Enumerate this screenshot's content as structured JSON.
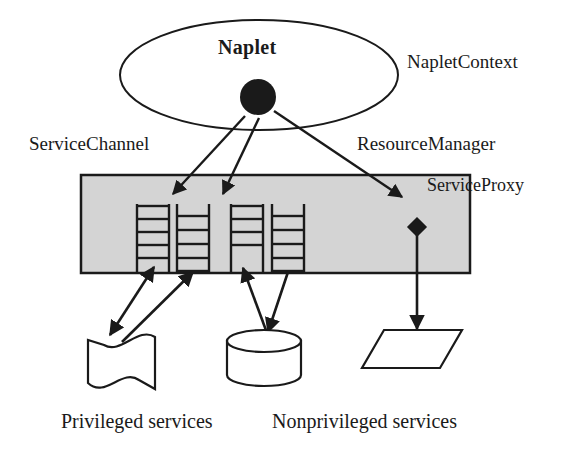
{
  "diagram": {
    "colors": {
      "stroke": "#1a1a1a",
      "gray_box_fill": "#d4d4d4",
      "shape_fill": "#ffffff",
      "text": "#1a1a1a"
    },
    "labels": {
      "naplet": "Naplet",
      "naplet_context": "NapletContext",
      "service_channel": "ServiceChannel",
      "resource_manager": "ResourceManager",
      "service_proxy": "ServiceProxy",
      "privileged_services": "Privileged services",
      "nonprivileged_services": "Nonprivileged services"
    },
    "shapes": {
      "context_ellipse": {
        "cx": 259,
        "cy": 75,
        "rx": 139,
        "ry": 55
      },
      "naplet_node": {
        "cx": 258,
        "cy": 97,
        "r": 18
      },
      "gray_box": {
        "x": 81,
        "y": 175,
        "width": 389,
        "height": 98
      },
      "ladders": [
        {
          "x": 136,
          "y": 204,
          "width": 34,
          "height": 68,
          "rungs": 5
        },
        {
          "x": 176,
          "y": 204,
          "width": 34,
          "height": 68,
          "rungs": 5
        },
        {
          "x": 230,
          "y": 204,
          "width": 34,
          "height": 68,
          "rungs": 5
        },
        {
          "x": 271,
          "y": 204,
          "width": 34,
          "height": 68,
          "rungs": 5
        }
      ],
      "proxy_diamond": {
        "cx": 417,
        "cy": 227,
        "size": 9
      },
      "document": {
        "x": 88,
        "y": 330,
        "width": 67,
        "height": 55
      },
      "cylinder": {
        "cx": 264,
        "cy": 358,
        "rx": 37,
        "ry": 11,
        "top": 330,
        "bottom": 386
      },
      "parallelogram": {
        "x": 362,
        "y": 330,
        "width": 100,
        "height": 38,
        "skew": 22
      }
    },
    "connections": [
      {
        "name": "naplet-to-channel-1",
        "from": [
          245,
          114
        ],
        "to": [
          172,
          193
        ],
        "arrow": "end"
      },
      {
        "name": "naplet-to-channel-2",
        "from": [
          262,
          116
        ],
        "to": [
          222,
          193
        ],
        "arrow": "end"
      },
      {
        "name": "naplet-to-proxy",
        "from": [
          273,
          110
        ],
        "to": [
          403,
          196
        ],
        "arrow": "end"
      },
      {
        "name": "ladder1-to-document",
        "from": [
          152,
          272
        ],
        "to": [
          108,
          336
        ],
        "arrow": "both"
      },
      {
        "name": "ladder2-to-document",
        "from": [
          190,
          272
        ],
        "to": [
          120,
          338
        ],
        "arrow": "start"
      },
      {
        "name": "ladder3-to-cylinder",
        "from": [
          243,
          272
        ],
        "to": [
          268,
          334
        ],
        "arrow": "start"
      },
      {
        "name": "ladder4-to-cylinder",
        "from": [
          287,
          272
        ],
        "to": [
          268,
          334
        ],
        "arrow": "end"
      },
      {
        "name": "proxy-to-parallelogram",
        "from": [
          417,
          236
        ],
        "to": [
          417,
          330
        ],
        "arrow": "end"
      }
    ]
  }
}
